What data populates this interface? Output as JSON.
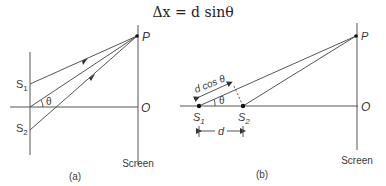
{
  "equation": "Δx = d sinθ",
  "figure_a": {
    "caption": "(a)",
    "labels": {
      "P": "P",
      "O": "O",
      "S1": "S",
      "S1_sub": "1",
      "S2": "S",
      "S2_sub": "2",
      "theta": "θ",
      "screen": "Screen"
    }
  },
  "figure_b": {
    "caption": "(b)",
    "labels": {
      "P": "P",
      "O": "O",
      "S1": "S",
      "S1_sub": "1",
      "S2": "S",
      "S2_sub": "2",
      "theta": "θ",
      "dcos": "d cos θ",
      "d": "d",
      "screen": "Screen"
    }
  }
}
